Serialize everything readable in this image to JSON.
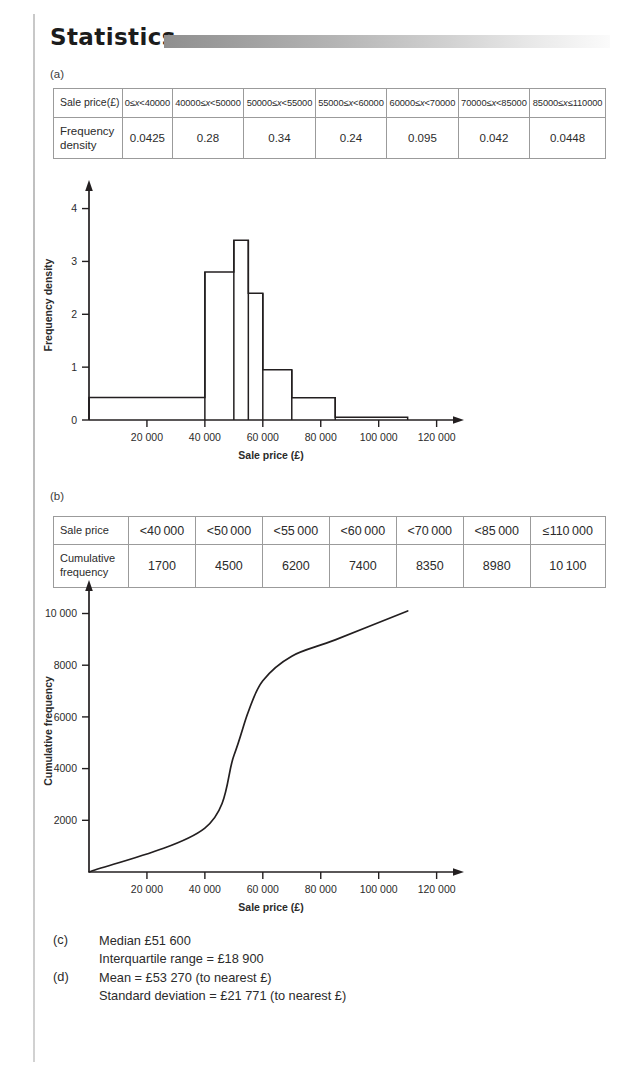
{
  "heading": {
    "title": "Statistics",
    "bar_gradient_from": "#8f8f8f",
    "bar_gradient_to": "#fbfbfb"
  },
  "parts": {
    "a_label": "(a)",
    "b_label": "(b)"
  },
  "table_a": {
    "row_headers": [
      "Sale price(£)",
      "Frequency density"
    ],
    "row_header_1_line1": "Sale price(£)",
    "row_header_2_line1": "Frequency",
    "row_header_2_line2": "density",
    "intervals": [
      "0≤x<40000",
      "40000≤x<50000",
      "50000≤x<55000",
      "55000≤x<60000",
      "60000≤x<70000",
      "70000≤x<85000",
      "85000≤x≤110000"
    ],
    "frequency_density": [
      "0.0425",
      "0.28",
      "0.34",
      "0.24",
      "0.095",
      "0.042",
      "0.0448"
    ]
  },
  "table_b": {
    "row_header_1": "Sale price",
    "row_header_2_line1": "Cumulative",
    "row_header_2_line2": "frequency",
    "sale_price": [
      "<40 000",
      "<50 000",
      "<55 000",
      "<60 000",
      "<70 000",
      "<85 000",
      "≤110 000"
    ],
    "cumulative_frequency": [
      "1700",
      "4500",
      "6200",
      "7400",
      "8350",
      "8980",
      "10 100"
    ]
  },
  "chart_data": [
    {
      "type": "bar",
      "name": "histogram",
      "title": "",
      "xlabel": "Sale price (£)",
      "ylabel": "Frequency density",
      "xlim": [
        0,
        126000
      ],
      "ylim": [
        0,
        4.2
      ],
      "xticks": [
        20000,
        40000,
        60000,
        80000,
        100000,
        120000
      ],
      "xtick_labels": [
        "20 000",
        "40 000",
        "60 000",
        "80 000",
        "100 000",
        "120 000"
      ],
      "yticks": [
        0,
        1,
        2,
        3,
        4
      ],
      "ytick_labels": [
        "0",
        "1",
        "2",
        "3",
        "4"
      ],
      "grid": false,
      "note": "y axis shows frequency density × 10 relative to the table values",
      "bins": [
        {
          "x0": 0,
          "x1": 40000,
          "height": 0.425,
          "table_value": 0.0425
        },
        {
          "x0": 40000,
          "x1": 50000,
          "height": 2.8,
          "table_value": 0.28
        },
        {
          "x0": 50000,
          "x1": 55000,
          "height": 3.4,
          "table_value": 0.34
        },
        {
          "x0": 55000,
          "x1": 60000,
          "height": 2.4,
          "table_value": 0.24
        },
        {
          "x0": 60000,
          "x1": 70000,
          "height": 0.95,
          "table_value": 0.095
        },
        {
          "x0": 70000,
          "x1": 85000,
          "height": 0.42,
          "table_value": 0.042
        },
        {
          "x0": 85000,
          "x1": 110000,
          "height": 0.05,
          "table_value": 0.0448
        }
      ]
    },
    {
      "type": "line",
      "name": "cumulative-frequency-curve",
      "title": "",
      "xlabel": "Sale price (£)",
      "ylabel": "Cumulative frequency",
      "xlim": [
        0,
        126000
      ],
      "ylim": [
        0,
        10600
      ],
      "xticks": [
        20000,
        40000,
        60000,
        80000,
        100000,
        120000
      ],
      "xtick_labels": [
        "20 000",
        "40 000",
        "60 000",
        "80 000",
        "100 000",
        "120 000"
      ],
      "yticks": [
        2000,
        4000,
        6000,
        8000,
        10000
      ],
      "ytick_labels": [
        "2000",
        "4000",
        "6000",
        "8000",
        "10 000"
      ],
      "grid": false,
      "x": [
        0,
        40000,
        50000,
        55000,
        60000,
        70000,
        85000,
        110000
      ],
      "y": [
        0,
        1700,
        4500,
        6200,
        7400,
        8350,
        8980,
        10100
      ]
    }
  ],
  "answers": [
    {
      "tag": "(c)",
      "lines": [
        "Median £51 600",
        "Interquartile range = £18 900"
      ]
    },
    {
      "tag": "(d)",
      "lines": [
        "Mean = £53 270 (to nearest £)",
        "Standard deviation = £21 771 (to nearest £)"
      ]
    }
  ]
}
